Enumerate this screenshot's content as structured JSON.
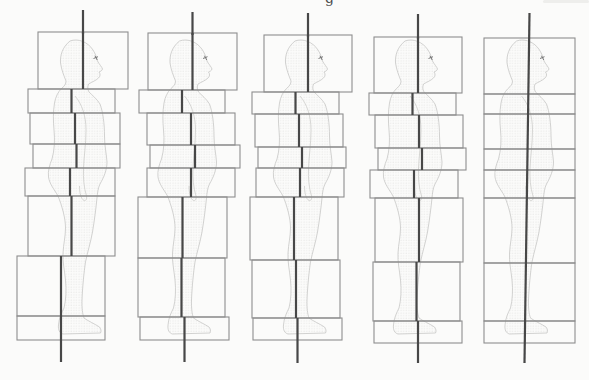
{
  "page": {
    "background": "#fbfbfa",
    "cropped_text_remnant": "g"
  },
  "diagram": {
    "parts_order": [
      "head",
      "shoulders",
      "chest",
      "waist",
      "pelvis",
      "thighs",
      "lower-legs",
      "feet"
    ],
    "colors": {
      "plumb_line": "#474747",
      "box_border": "#8e8e8e",
      "silhouette_outline": "#c2c2c0",
      "silhouette_stipple": "#c9c9c7",
      "background": "#fbfbfa"
    },
    "figures": [
      {
        "index": 1,
        "alignment": "most-misaligned",
        "line": {
          "style": "segmented",
          "top_y": 10,
          "bottom_y": 362
        },
        "boxes": [
          {
            "part": "head",
            "x": 38,
            "y": 32,
            "w": 90,
            "h": 57
          },
          {
            "part": "shoulders",
            "x": 28,
            "y": 89,
            "w": 87,
            "h": 24
          },
          {
            "part": "chest",
            "x": 30,
            "y": 113,
            "w": 90,
            "h": 31
          },
          {
            "part": "waist",
            "x": 33,
            "y": 144,
            "w": 87,
            "h": 24
          },
          {
            "part": "pelvis",
            "x": 25,
            "y": 168,
            "w": 90,
            "h": 28
          },
          {
            "part": "thighs",
            "x": 28,
            "y": 196,
            "w": 87,
            "h": 60
          },
          {
            "part": "lower-legs",
            "x": 17,
            "y": 256,
            "w": 88,
            "h": 60
          },
          {
            "part": "feet",
            "x": 17,
            "y": 316,
            "w": 88,
            "h": 24
          }
        ]
      },
      {
        "index": 2,
        "alignment": "misaligned",
        "line": {
          "style": "segmented",
          "top_y": 12,
          "bottom_y": 362
        },
        "boxes": [
          {
            "part": "head",
            "x": 148,
            "y": 33,
            "w": 89,
            "h": 57
          },
          {
            "part": "shoulders",
            "x": 139,
            "y": 90,
            "w": 86,
            "h": 23
          },
          {
            "part": "chest",
            "x": 147,
            "y": 113,
            "w": 88,
            "h": 32
          },
          {
            "part": "waist",
            "x": 150,
            "y": 145,
            "w": 90,
            "h": 23
          },
          {
            "part": "pelvis",
            "x": 147,
            "y": 168,
            "w": 88,
            "h": 29
          },
          {
            "part": "thighs",
            "x": 138,
            "y": 197,
            "w": 89,
            "h": 61
          },
          {
            "part": "lower-legs",
            "x": 138,
            "y": 258,
            "w": 87,
            "h": 59
          },
          {
            "part": "feet",
            "x": 140,
            "y": 317,
            "w": 89,
            "h": 23
          }
        ]
      },
      {
        "index": 3,
        "alignment": "moderately-misaligned",
        "line": {
          "style": "segmented",
          "top_y": 13,
          "bottom_y": 363
        },
        "boxes": [
          {
            "part": "head",
            "x": 264,
            "y": 35,
            "w": 88,
            "h": 57
          },
          {
            "part": "shoulders",
            "x": 252,
            "y": 92,
            "w": 87,
            "h": 22
          },
          {
            "part": "chest",
            "x": 255,
            "y": 114,
            "w": 88,
            "h": 33
          },
          {
            "part": "waist",
            "x": 258,
            "y": 147,
            "w": 88,
            "h": 21
          },
          {
            "part": "pelvis",
            "x": 256,
            "y": 168,
            "w": 88,
            "h": 29
          },
          {
            "part": "thighs",
            "x": 250,
            "y": 197,
            "w": 88,
            "h": 63
          },
          {
            "part": "lower-legs",
            "x": 252,
            "y": 260,
            "w": 88,
            "h": 58
          },
          {
            "part": "feet",
            "x": 253,
            "y": 318,
            "w": 89,
            "h": 22
          }
        ]
      },
      {
        "index": 4,
        "alignment": "nearly-aligned",
        "line": {
          "style": "segmented",
          "top_y": 14,
          "bottom_y": 363
        },
        "boxes": [
          {
            "part": "head",
            "x": 374,
            "y": 37,
            "w": 88,
            "h": 56
          },
          {
            "part": "shoulders",
            "x": 369,
            "y": 93,
            "w": 87,
            "h": 22
          },
          {
            "part": "chest",
            "x": 375,
            "y": 115,
            "w": 88,
            "h": 33
          },
          {
            "part": "waist",
            "x": 378,
            "y": 148,
            "w": 88,
            "h": 22
          },
          {
            "part": "pelvis",
            "x": 370,
            "y": 170,
            "w": 88,
            "h": 28
          },
          {
            "part": "thighs",
            "x": 375,
            "y": 198,
            "w": 88,
            "h": 64
          },
          {
            "part": "lower-legs",
            "x": 373,
            "y": 262,
            "w": 87,
            "h": 59
          },
          {
            "part": "feet",
            "x": 374,
            "y": 321,
            "w": 88,
            "h": 22
          }
        ]
      },
      {
        "index": 5,
        "alignment": "aligned-single-column",
        "line": {
          "style": "straight",
          "x_top": 529.5,
          "x_bottom": 524.5,
          "top_y": 13,
          "bottom_y": 363
        },
        "boxes": [
          {
            "part": "head",
            "x": 484,
            "y": 38,
            "w": 91,
            "h": 56
          },
          {
            "part": "shoulders",
            "x": 484,
            "y": 94,
            "w": 91,
            "h": 20
          },
          {
            "part": "chest",
            "x": 484,
            "y": 114,
            "w": 91,
            "h": 35
          },
          {
            "part": "waist",
            "x": 484,
            "y": 149,
            "w": 91,
            "h": 21
          },
          {
            "part": "pelvis",
            "x": 484,
            "y": 170,
            "w": 91,
            "h": 28
          },
          {
            "part": "thighs",
            "x": 484,
            "y": 198,
            "w": 91,
            "h": 65
          },
          {
            "part": "lower-legs",
            "x": 484,
            "y": 263,
            "w": 91,
            "h": 58
          },
          {
            "part": "feet",
            "x": 484,
            "y": 321,
            "w": 91,
            "h": 22
          }
        ]
      }
    ]
  }
}
